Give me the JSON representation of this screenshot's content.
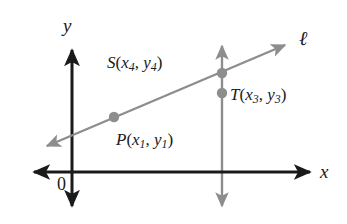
{
  "figure": {
    "background_color": "#ffffff",
    "axis_color": "#1a1a1a",
    "line_color": "#8d8d8d",
    "point_color": "#8d8d8d",
    "label_color": "#1a1a1a"
  },
  "axes": {
    "x_label": "x",
    "y_label": "y",
    "origin_label": "0"
  },
  "line": {
    "name_label": "ℓ"
  },
  "points": [
    {
      "id": "P",
      "name": "P",
      "open_paren": "(",
      "x_var": "x",
      "x_sub": "1",
      "separator": ", ",
      "y_var": "y",
      "y_sub": "1",
      "close_paren": ")",
      "full_label": "P(x1, y1)"
    },
    {
      "id": "S",
      "name": "S",
      "open_paren": "(",
      "x_var": "x",
      "x_sub": "4",
      "separator": ", ",
      "y_var": "y",
      "y_sub": "4",
      "close_paren": ")",
      "full_label": "S(x4, y4)"
    },
    {
      "id": "T",
      "name": "T",
      "open_paren": "(",
      "x_var": "x",
      "x_sub": "3",
      "separator": ", ",
      "y_var": "y",
      "y_sub": "3",
      "close_paren": ")",
      "full_label": "T(x3, y3)"
    }
  ]
}
